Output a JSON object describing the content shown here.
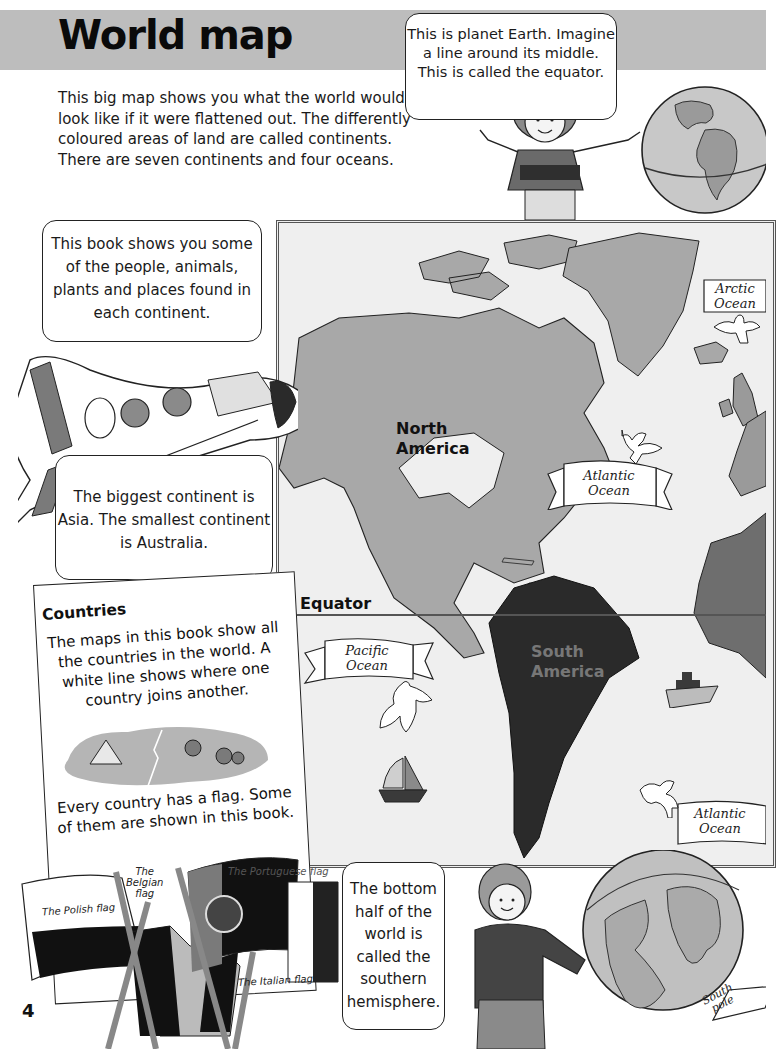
{
  "header": {
    "title": "World map"
  },
  "intro": {
    "text": "This big map shows you what the world would look like if it were flattened out. The differently coloured areas of land are called continents. There are seven continents and four oceans."
  },
  "bubbles": {
    "earth": "This is planet Earth. Imagine a line around its middle. This is called the equator.",
    "book": "This book shows you some of the people, animals, plants and places found in each continent.",
    "asia": "The biggest continent is Asia. The smallest continent is Australia.",
    "south": "The bottom half of the world is called the southern hemisphere."
  },
  "map": {
    "equator_label": "Equator",
    "continents": {
      "north_america_line1": "North",
      "north_america_line2": "America",
      "south_america_line1": "South",
      "south_america_line2": "America"
    },
    "oceans": {
      "arctic_line1": "Arctic",
      "arctic_line2": "Ocean",
      "atlantic_north_line1": "Atlantic",
      "atlantic_north_line2": "Ocean",
      "pacific_line1": "Pacific",
      "pacific_line2": "Ocean",
      "atlantic_south_line1": "Atlantic",
      "atlantic_south_line2": "Ocean"
    },
    "south_pole_line1": "South",
    "south_pole_line2": "pole",
    "colors": {
      "background": "#efefef",
      "north_america": "#a8a8a8",
      "south_america": "#2a2a2a",
      "africa": "#6e6e6e",
      "europe": "#9a9a9a",
      "greenland": "#a8a8a8"
    }
  },
  "countries": {
    "title": "Countries",
    "text": "The maps in this book show all the countries in the world. A white line shows where one country joins another.",
    "flag_text": "Every country has a flag. Some of them are shown in this book.",
    "flags": {
      "polish": "The Polish flag",
      "belgian_line1": "The",
      "belgian_line2": "Belgian",
      "belgian_line3": "flag",
      "portuguese": "The Portuguese flag",
      "italian": "The Italian flag"
    }
  },
  "footer": {
    "page_number": "4"
  }
}
